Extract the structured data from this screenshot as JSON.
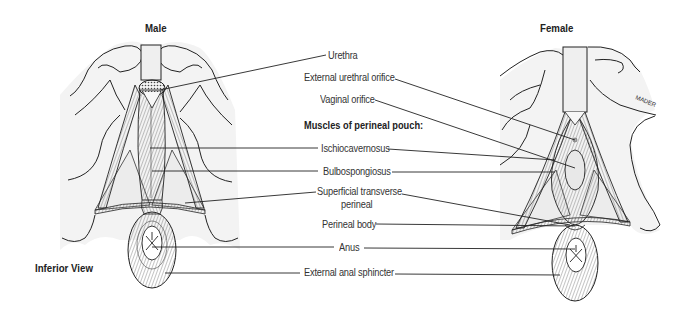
{
  "figure": {
    "view_label": "Inferior View",
    "panels": [
      {
        "id": "male",
        "title": "Male"
      },
      {
        "id": "female",
        "title": "Female"
      }
    ],
    "signature": "MADER"
  },
  "labels": {
    "urethra": "Urethra",
    "external_urethral_orifice": "External urethral orifice",
    "vaginal_orifice": "Vaginal orifice",
    "muscles_heading": "Muscles of perineal pouch:",
    "ischiocavernosus": "Ischiocavernosus",
    "bulbospongiosus": "Bulbospongiosus",
    "superficial_transverse_line1": "Superficial transverse",
    "superficial_transverse_line2": "perineal",
    "perineal_body": "Perineal body",
    "anus": "Anus",
    "external_anal_sphincter": "External anal sphincter"
  }
}
